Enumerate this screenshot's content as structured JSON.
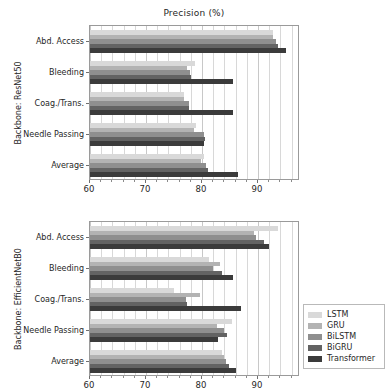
{
  "figure": {
    "title": "Precision (%)"
  },
  "legend": {
    "position": "center-right",
    "items": [
      {
        "label": "LSTM",
        "color": "#d9d9d9"
      },
      {
        "label": "GRU",
        "color": "#b3b3b3"
      },
      {
        "label": "BiLSTM",
        "color": "#8f8f8f"
      },
      {
        "label": "BiGRU",
        "color": "#636363"
      },
      {
        "label": "Transformer",
        "color": "#3b3b3b"
      }
    ]
  },
  "panels": [
    {
      "ylabel": "Backbone: ResNet50",
      "title": "Precision (%)"
    },
    {
      "ylabel": "Backbone: EfficientNetB0",
      "title": ""
    }
  ],
  "chart_data": [
    {
      "type": "bar",
      "orientation": "horizontal",
      "title": "Precision (%)",
      "xlabel": "",
      "ylabel": "Backbone: ResNet50",
      "xlim": [
        60,
        97.5
      ],
      "xticks": [
        60,
        70,
        80,
        90
      ],
      "xtick_labels": [
        "60",
        "70",
        "80",
        "90"
      ],
      "grid": true,
      "grid_axis": "x",
      "categories": [
        "Abd. Access",
        "Bleeding",
        "Coag./Trans.",
        "Needle Passing",
        "Average"
      ],
      "series": [
        {
          "name": "LSTM",
          "values": [
            92.6,
            78.8,
            76.8,
            78.9,
            80.4
          ]
        },
        {
          "name": "GRU",
          "values": [
            92.6,
            77.3,
            76.8,
            78.5,
            79.8
          ]
        },
        {
          "name": "BiLSTM",
          "values": [
            93.2,
            77.8,
            77.6,
            80.4,
            80.7
          ]
        },
        {
          "name": "BiGRU",
          "values": [
            93.6,
            78.0,
            77.7,
            80.5,
            81.1
          ]
        },
        {
          "name": "Transformer",
          "values": [
            95.0,
            85.5,
            85.5,
            80.4,
            86.4
          ]
        }
      ]
    },
    {
      "type": "bar",
      "orientation": "horizontal",
      "title": "",
      "xlabel": "",
      "ylabel": "Backbone: EfficientNetB0",
      "xlim": [
        60,
        97.5
      ],
      "xticks": [
        60,
        70,
        80,
        90
      ],
      "xtick_labels": [
        "60",
        "70",
        "80",
        "90"
      ],
      "grid": true,
      "grid_axis": "x",
      "categories": [
        "Abd. Access",
        "Bleeding",
        "Coag./Trans.",
        "Needle Passing",
        "Average"
      ],
      "series": [
        {
          "name": "LSTM",
          "values": [
            93.5,
            81.3,
            75.0,
            85.3,
            83.6
          ]
        },
        {
          "name": "GRU",
          "values": [
            89.3,
            83.3,
            79.6,
            82.6,
            84.0
          ]
        },
        {
          "name": "BiLSTM",
          "values": [
            89.6,
            82.0,
            77.2,
            83.9,
            84.3
          ]
        },
        {
          "name": "BiGRU",
          "values": [
            91.0,
            83.6,
            77.3,
            84.4,
            84.9
          ]
        },
        {
          "name": "Transformer",
          "values": [
            92.0,
            85.5,
            87.0,
            82.8,
            86.0
          ]
        }
      ]
    }
  ]
}
